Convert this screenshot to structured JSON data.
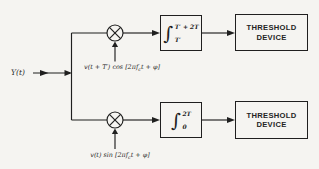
{
  "figure": {
    "background": "#f5f4f1",
    "ink": "#1f1f1f",
    "input_label": "Y(t)",
    "icons": {
      "multiplier": "circle-times",
      "arrowhead": "solid-triangle"
    },
    "branches": {
      "top": {
        "carrier_label": {
          "pre": "v(t + T′) cos [2πf",
          "sub": "c",
          "post": "t + φ]"
        },
        "integrator": {
          "glyph": "∫",
          "upper_limit": "T′ + 2T",
          "lower_limit": "T′"
        },
        "threshold": {
          "line1": "THRESHOLD",
          "line2": "DEVICE"
        }
      },
      "bottom": {
        "carrier_label": {
          "pre": "v(t) sin [2πf",
          "sub": "c",
          "post": "t + φ]"
        },
        "integrator": {
          "glyph": "∫",
          "upper_limit": "2T",
          "lower_limit": "0"
        },
        "threshold": {
          "line1": "THRESHOLD",
          "line2": "DEVICE"
        }
      }
    }
  }
}
